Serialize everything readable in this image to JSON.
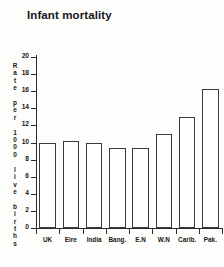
{
  "chart_data": {
    "type": "bar",
    "title": "Infant mortality",
    "xlabel": "",
    "ylabel": "Rate per 1000 live births",
    "categories": [
      "UK",
      "Eire",
      "India",
      "Bang.",
      "E.N",
      "W.N",
      "Carib.",
      "Pak."
    ],
    "values": [
      9.9,
      10.2,
      10.0,
      9.3,
      9.3,
      11.0,
      13.0,
      16.3
    ],
    "ylim": [
      0,
      20
    ],
    "yticks": [
      0,
      2,
      4,
      6,
      8,
      10,
      12,
      14,
      16,
      18,
      20
    ],
    "ytick_labels": [
      "0",
      "2",
      "4",
      "6",
      "8",
      "10",
      "12",
      "14",
      "16",
      "18",
      "20"
    ],
    "grid": false,
    "legend": "none",
    "bar_fill_color": "#ffffff",
    "bar_edge_color": "#3a3a3a",
    "axis_color": "#2b2b2b",
    "background_color": "#fdfdfc"
  },
  "ylabel_chars": [
    "R",
    "a",
    "t",
    "e",
    "",
    "p",
    "e",
    "r",
    "",
    "1",
    "0",
    "0",
    "0",
    "",
    "l",
    "i",
    "v",
    "e",
    "",
    "b",
    "i",
    "r",
    "t",
    "h",
    "s"
  ]
}
